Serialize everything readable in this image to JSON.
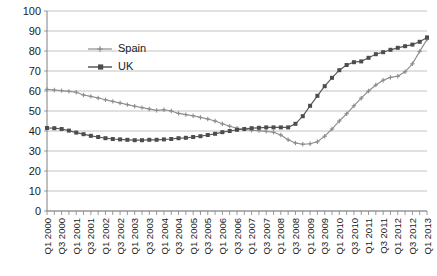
{
  "chart_data": {
    "type": "line",
    "title": "",
    "xlabel": "",
    "ylabel": "",
    "ylim": [
      0,
      100
    ],
    "ytick_step": 10,
    "yticks": [
      0,
      10,
      20,
      30,
      40,
      50,
      60,
      70,
      80,
      90,
      100
    ],
    "grid": true,
    "legend_position": "inside-top-left",
    "x": [
      "Q1 2000",
      "Q2 2000",
      "Q3 2000",
      "Q4 2000",
      "Q1 2001",
      "Q2 2001",
      "Q3 2001",
      "Q4 2001",
      "Q1 2002",
      "Q2 2002",
      "Q3 2002",
      "Q4 2002",
      "Q1 2003",
      "Q2 2003",
      "Q3 2003",
      "Q4 2003",
      "Q1 2004",
      "Q2 2004",
      "Q3 2004",
      "Q4 2004",
      "Q1 2005",
      "Q2 2005",
      "Q3 2005",
      "Q4 2005",
      "Q1 2006",
      "Q2 2006",
      "Q3 2006",
      "Q4 2006",
      "Q1 2007",
      "Q2 2007",
      "Q3 2007",
      "Q4 2007",
      "Q1 2008",
      "Q2 2008",
      "Q3 2008",
      "Q4 2008",
      "Q1 2009",
      "Q2 2009",
      "Q3 2009",
      "Q4 2009",
      "Q1 2010",
      "Q2 2010",
      "Q3 2010",
      "Q4 2010",
      "Q1 2011",
      "Q2 2011",
      "Q3 2011",
      "Q4 2011",
      "Q1 2012",
      "Q2 2012",
      "Q3 2012",
      "Q4 2012",
      "Q1 2013"
    ],
    "xtick_labels": [
      "Q1 2000",
      "Q3 2000",
      "Q1 2001",
      "Q3 2001",
      "Q1 2002",
      "Q3 2002",
      "Q1 2003",
      "Q3 2003",
      "Q1 2004",
      "Q3 2004",
      "Q1 2005",
      "Q3 2005",
      "Q1 2006",
      "Q3 2006",
      "Q1 2007",
      "Q3 2007",
      "Q1 2008",
      "Q3 2008",
      "Q1 2009",
      "Q3 2009",
      "Q1 2010",
      "Q3 2010",
      "Q1 2011",
      "Q3 2011",
      "Q1 2012",
      "Q3 2012",
      "Q1 2013"
    ],
    "xtick_indices": [
      0,
      2,
      4,
      6,
      8,
      10,
      12,
      14,
      16,
      18,
      20,
      22,
      24,
      26,
      28,
      30,
      32,
      34,
      36,
      38,
      40,
      42,
      44,
      46,
      48,
      50,
      52
    ],
    "series": [
      {
        "name": "Spain",
        "color": "#8c8c8c",
        "marker": "cross",
        "values": [
          60.8,
          60.5,
          60.2,
          59.8,
          59.4,
          58.0,
          57.3,
          56.5,
          55.6,
          54.8,
          54.0,
          53.2,
          52.4,
          51.7,
          51.0,
          50.3,
          50.6,
          50.0,
          48.8,
          48.2,
          47.6,
          46.8,
          46.0,
          45.0,
          43.6,
          42.4,
          41.4,
          40.8,
          40.4,
          40.2,
          39.8,
          39.4,
          38.0,
          35.6,
          34.0,
          33.4,
          33.6,
          34.6,
          37.4,
          41.0,
          45.0,
          48.6,
          52.6,
          56.4,
          60.0,
          63.0,
          65.4,
          66.8,
          67.4,
          69.6,
          73.6,
          79.8,
          85.8
        ]
      },
      {
        "name": "UK",
        "color": "#4d4d4d",
        "marker": "square",
        "values": [
          41.5,
          41.4,
          41.0,
          40.2,
          39.2,
          38.4,
          37.6,
          37.0,
          36.4,
          36.0,
          35.8,
          35.6,
          35.4,
          35.4,
          35.6,
          35.6,
          35.8,
          36.0,
          36.4,
          36.6,
          37.0,
          37.4,
          38.0,
          38.6,
          39.4,
          40.0,
          40.6,
          41.0,
          41.4,
          41.6,
          41.8,
          41.8,
          41.8,
          41.8,
          43.6,
          47.4,
          52.6,
          57.6,
          62.4,
          66.6,
          70.4,
          73.0,
          74.4,
          74.8,
          76.6,
          78.4,
          79.4,
          80.6,
          81.6,
          82.4,
          83.2,
          84.6,
          86.8
        ]
      }
    ]
  },
  "legend": {
    "items": [
      {
        "label": "Spain"
      },
      {
        "label": "UK"
      }
    ]
  }
}
